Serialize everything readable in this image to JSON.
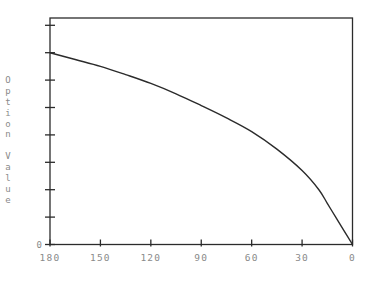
{
  "chart_data": {
    "type": "line",
    "title": "",
    "xlabel": "",
    "ylabel": "Option Value",
    "x_ticks": [
      180,
      150,
      120,
      90,
      60,
      30,
      0
    ],
    "x_tick_labels": [
      "180",
      "150",
      "120",
      "90",
      "60",
      "30",
      "0"
    ],
    "xlim": [
      180,
      0
    ],
    "x_reversed": true,
    "y_tick_labels": [
      "0"
    ],
    "y_tick_count": 9,
    "ylim": [
      0,
      8.6
    ],
    "grid": false,
    "legend": null,
    "series": [
      {
        "name": "Option Value",
        "x": [
          180,
          165,
          150,
          135,
          120,
          105,
          90,
          75,
          60,
          45,
          30,
          20,
          15,
          10,
          5,
          0
        ],
        "values": [
          7.0,
          6.75,
          6.5,
          6.2,
          5.88,
          5.5,
          5.07,
          4.62,
          4.12,
          3.48,
          2.7,
          2.0,
          1.5,
          1.0,
          0.5,
          0.0
        ]
      }
    ]
  },
  "colors": {
    "axis": "#2b2b2b",
    "line": "#2b2b2b",
    "label": "#8a8a8a",
    "background": "#ffffff"
  }
}
